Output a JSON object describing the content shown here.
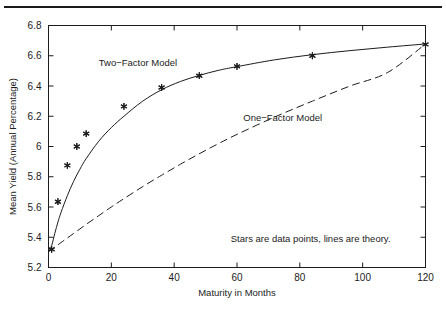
{
  "figure": {
    "background_color": "#ffffff",
    "ink_color": "#1c1c1c",
    "top_rule": true
  },
  "chart_data": {
    "type": "line",
    "title": "",
    "xlabel": "Maturity in Months",
    "ylabel": "Mean Yield (Annual Percentage)",
    "xlim": [
      0,
      120
    ],
    "ylim": [
      5.2,
      6.8
    ],
    "xticks": [
      0,
      20,
      40,
      60,
      80,
      100,
      120
    ],
    "xtick_labels": [
      "0",
      "20",
      "40",
      "60",
      "80",
      "100",
      "120"
    ],
    "yticks": [
      5.2,
      5.4,
      5.6,
      5.8,
      6.0,
      6.2,
      6.4,
      6.6,
      6.8
    ],
    "ytick_labels": [
      "5.2",
      "5.4",
      "5.6",
      "5.8",
      "6",
      "6.2",
      "6.4",
      "6.6",
      "6.8"
    ],
    "grid": false,
    "legend_position": "inline-annotations",
    "annotations": [
      {
        "text": "Two−Factor Model",
        "x": 16,
        "y": 6.53
      },
      {
        "text": "One−Factor Model",
        "x": 62,
        "y": 6.17
      },
      {
        "text": "Stars are data points, lines are theory.",
        "x": 58,
        "y": 5.37
      }
    ],
    "scatter": {
      "name": "Data points",
      "marker": "star",
      "x": [
        1,
        3,
        6,
        9,
        12,
        24,
        36,
        48,
        60,
        84,
        120
      ],
      "y": [
        5.32,
        5.635,
        5.875,
        6.0,
        6.085,
        6.265,
        6.39,
        6.468,
        6.53,
        6.6,
        6.675
      ]
    },
    "series": [
      {
        "name": "Two−Factor Model",
        "style": "solid",
        "x": [
          0,
          1,
          2,
          3,
          4,
          6,
          8,
          10,
          12,
          16,
          20,
          24,
          30,
          36,
          42,
          48,
          54,
          60,
          72,
          84,
          96,
          108,
          120
        ],
        "y": [
          5.305,
          5.345,
          5.425,
          5.5,
          5.565,
          5.675,
          5.77,
          5.85,
          5.92,
          6.035,
          6.125,
          6.2,
          6.3,
          6.375,
          6.43,
          6.47,
          6.503,
          6.528,
          6.573,
          6.607,
          6.634,
          6.657,
          6.678
        ]
      },
      {
        "name": "One−Factor Model",
        "style": "dashed",
        "x": [
          0,
          4,
          8,
          12,
          16,
          20,
          24,
          30,
          36,
          42,
          48,
          54,
          60,
          72,
          84,
          96,
          108,
          120
        ],
        "y": [
          5.305,
          5.365,
          5.425,
          5.485,
          5.543,
          5.6,
          5.655,
          5.735,
          5.81,
          5.883,
          5.952,
          6.018,
          6.08,
          6.195,
          6.3,
          6.4,
          6.49,
          6.678
        ]
      }
    ]
  }
}
